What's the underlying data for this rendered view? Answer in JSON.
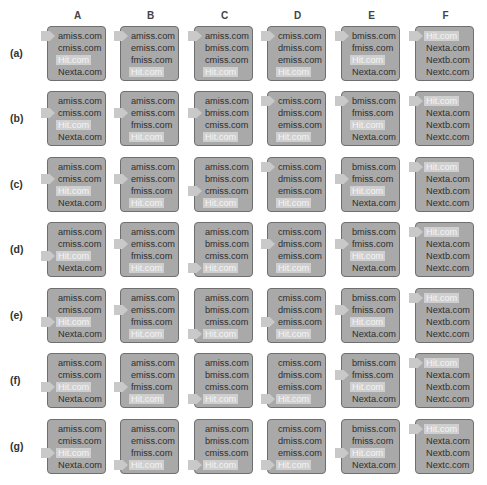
{
  "columns": [
    "A",
    "B",
    "C",
    "D",
    "E",
    "F"
  ],
  "column_lists": {
    "A": [
      "amiss.com",
      "cmiss.com",
      "Hit.com",
      "Nexta.com"
    ],
    "B": [
      "amiss.com",
      "emiss.com",
      "fmiss.com",
      "Hit.com"
    ],
    "C": [
      "amiss.com",
      "bmiss.com",
      "cmiss.com",
      "Hit.com"
    ],
    "D": [
      "cmiss.com",
      "dmiss.com",
      "emiss.com",
      "Hit.com"
    ],
    "E": [
      "bmiss.com",
      "fmiss.com",
      "Hit.com",
      "Nexta.com"
    ],
    "F": [
      "Hit.com",
      "Nexta.com",
      "Nextb.com",
      "Nextc.com"
    ]
  },
  "highlight_item": "Hit.com",
  "colors": {
    "cell_bg": "#a9a9a9",
    "cell_border": "#6f6f6f",
    "pointer": "#c9c9c9",
    "hit_bg": "#cfcfcf",
    "hit_text": "#f4f4f4"
  },
  "rows": [
    {
      "label": "(a)",
      "pointer_index": {
        "A": 0,
        "B": 0,
        "C": 0,
        "D": 0,
        "E": 0,
        "F": 0
      }
    },
    {
      "label": "(b)",
      "pointer_index": {
        "A": 1,
        "B": 1,
        "C": 1,
        "D": 0,
        "E": 0,
        "F": 0
      }
    },
    {
      "label": "(c)",
      "pointer_index": {
        "A": 1,
        "B": 1,
        "C": 2,
        "D": 0,
        "E": 1,
        "F": 0
      }
    },
    {
      "label": "(d)",
      "pointer_index": {
        "A": 2,
        "B": 1,
        "C": 3,
        "D": 1,
        "E": 1,
        "F": 0
      }
    },
    {
      "label": "(e)",
      "pointer_index": {
        "A": 2,
        "B": 1,
        "C": 3,
        "D": 2,
        "E": 1,
        "F": 0
      }
    },
    {
      "label": "(f)",
      "pointer_index": {
        "A": 2,
        "B": 2,
        "C": 3,
        "D": 3,
        "E": 1,
        "F": 0
      }
    },
    {
      "label": "(g)",
      "pointer_index": {
        "A": 2,
        "B": 3,
        "C": 3,
        "D": 3,
        "E": 2,
        "F": 0
      }
    }
  ]
}
